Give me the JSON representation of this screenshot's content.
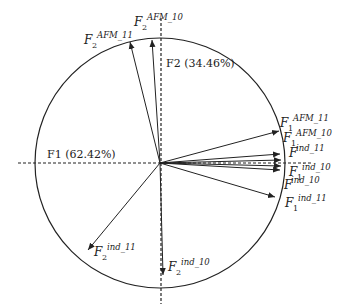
{
  "diagram": {
    "type": "correlation-circle",
    "axes": {
      "f1": {
        "label": "F1 (62.42%)"
      },
      "f2": {
        "label": "F2 (34.46%)"
      }
    },
    "vectors": [
      {
        "id": "F2_AFM_11",
        "base": "F",
        "sub": "2",
        "sup": "AFM_11"
      },
      {
        "id": "F2_AFM_10",
        "base": "F",
        "sub": "2",
        "sup": "AFM_10"
      },
      {
        "id": "F1_AFM_11",
        "base": "F",
        "sub": "1",
        "sup": "AFM_11"
      },
      {
        "id": "F1_AFM_10",
        "base": "F",
        "sub": "1",
        "sup": "AFM_10"
      },
      {
        "id": "F_ind_11",
        "base": "F",
        "sub": "",
        "sup": "ind_11"
      },
      {
        "id": "F1_ind_10",
        "base": "F",
        "sub": "1",
        "sup": "ind_10"
      },
      {
        "id": "F_ind_10",
        "base": "F",
        "sub": "",
        "sup": "ind_10"
      },
      {
        "id": "F1_ind_11",
        "base": "F",
        "sub": "1",
        "sup": "ind_11"
      },
      {
        "id": "F2_ind_11",
        "base": "F",
        "sub": "2",
        "sup": "ind_11"
      },
      {
        "id": "F2_ind_10",
        "base": "F",
        "sub": "2",
        "sup": "ind_10"
      }
    ]
  }
}
